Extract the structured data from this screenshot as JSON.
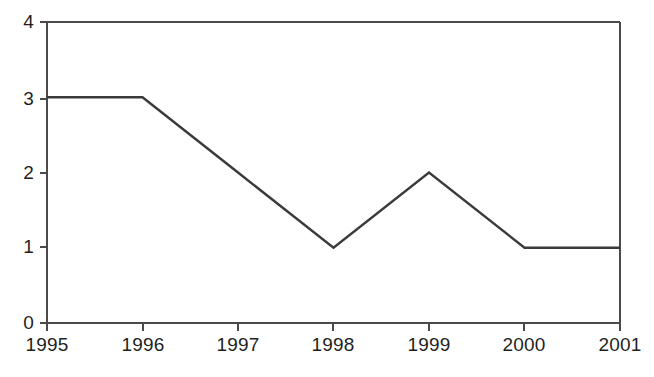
{
  "chart_data": {
    "type": "line",
    "title": "",
    "subtitle": "",
    "xlabel": "",
    "ylabel": "",
    "categories": [
      "1995",
      "1996",
      "1997",
      "1998",
      "1999",
      "2000",
      "2001"
    ],
    "x": [
      1995,
      1996,
      1997,
      1998,
      1999,
      2000,
      2001
    ],
    "values": [
      3,
      3,
      2,
      1,
      2,
      1,
      1
    ],
    "series": [
      {
        "name": "",
        "values": [
          3,
          3,
          2,
          1,
          2,
          1,
          1
        ]
      }
    ],
    "xlim": [
      1995,
      2001
    ],
    "ylim": [
      0,
      4
    ],
    "x_tick_labels": [
      "1995",
      "1996",
      "1997",
      "1998",
      "1999",
      "2000",
      "2001"
    ],
    "y_tick_labels": [
      "0",
      "1",
      "2",
      "3",
      "4"
    ],
    "y_ticks": [
      0,
      1,
      2,
      3,
      4
    ],
    "grid": false,
    "legend": false,
    "legend_position": "none",
    "annotations": [],
    "line_color": "#3a3a3a",
    "axis_color": "#4a4a4a",
    "background_color": "#ffffff",
    "markers": false
  },
  "axes": {
    "y_labels": [
      "4",
      "3",
      "2",
      "1",
      "0"
    ],
    "x_labels": [
      "1995",
      "1996",
      "1997",
      "1998",
      "1999",
      "2000",
      "2001"
    ]
  }
}
